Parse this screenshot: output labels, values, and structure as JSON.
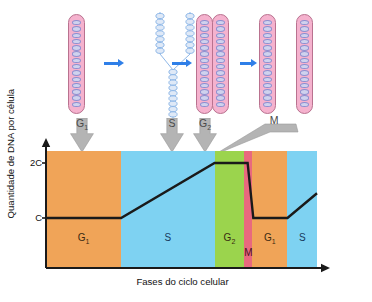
{
  "figure": {
    "credit": "OSVALDO SANCHES SEQUETIN",
    "stages": [
      {
        "name": "g1-chromosome",
        "label": "G₁",
        "label_main": "G",
        "label_sub": "1"
      },
      {
        "name": "s-replication-fork",
        "label": "S",
        "label_main": "S",
        "label_sub": ""
      },
      {
        "name": "g2-sister-chromatids",
        "label": "G₂",
        "label_main": "G",
        "label_sub": "2"
      },
      {
        "name": "m-separated-chromosomes",
        "label": "M",
        "label_main": "M",
        "label_sub": ""
      }
    ],
    "arrow_icons": [
      "arrow-right-icon",
      "arrow-right-icon",
      "arrow-right-icon"
    ]
  },
  "chart_data": {
    "type": "line",
    "title": "",
    "xlabel": "Fases do ciclo celular",
    "ylabel": "Quantidade de DNA por célula",
    "ytick_labels": [
      "2C",
      "C"
    ],
    "ytick_values": [
      2,
      1
    ],
    "ylim": [
      0,
      2.35
    ],
    "xlim": [
      0,
      100
    ],
    "grid": false,
    "legend": false,
    "x": [
      0,
      27.7,
      62.2,
      70.0,
      74.4,
      76.5,
      89.1,
      100
    ],
    "values": [
      1,
      1,
      2,
      2,
      2,
      1,
      1,
      1.45
    ],
    "series": [
      {
        "name": "DNA por célula",
        "color": "#1a1a1a",
        "points": [
          {
            "x": 0,
            "y": 1,
            "phase": "G1"
          },
          {
            "x": 27.7,
            "y": 1,
            "phase": "G1/S"
          },
          {
            "x": 62.2,
            "y": 2,
            "phase": "S/G2"
          },
          {
            "x": 70.0,
            "y": 2,
            "phase": "G2"
          },
          {
            "x": 74.4,
            "y": 2,
            "phase": "G2/M"
          },
          {
            "x": 76.5,
            "y": 1,
            "phase": "M"
          },
          {
            "x": 89.1,
            "y": 1,
            "phase": "G1"
          },
          {
            "x": 100,
            "y": 1.45,
            "phase": "S"
          }
        ]
      }
    ],
    "bands": [
      {
        "label": "G₁",
        "label_main": "G",
        "label_sub": "1",
        "x0": 0,
        "x1": 27.7,
        "color": "#f0a458",
        "name": "band-g1-first"
      },
      {
        "label": "S",
        "label_main": "S",
        "label_sub": "",
        "x0": 27.7,
        "x1": 62.2,
        "color": "#7ed2f2",
        "name": "band-s-first"
      },
      {
        "label": "G₂",
        "label_main": "G",
        "label_sub": "2",
        "x0": 62.2,
        "x1": 73.2,
        "color": "#9bd44d",
        "name": "band-g2"
      },
      {
        "label": "M",
        "label_main": "M",
        "label_sub": "",
        "x0": 73.2,
        "x1": 76.1,
        "color": "#e8697e",
        "name": "band-m"
      },
      {
        "label": "G₁",
        "label_main": "G",
        "label_sub": "1",
        "x0": 76.1,
        "x1": 89.1,
        "color": "#f0a458",
        "name": "band-g1-second"
      },
      {
        "label": "S",
        "label_main": "S",
        "label_sub": "",
        "x0": 89.1,
        "x1": 100,
        "color": "#7ed2f2",
        "name": "band-s-second"
      }
    ],
    "colors": {
      "g1": "#f0a458",
      "s": "#7ed2f2",
      "g2": "#9bd44d",
      "m": "#e8697e",
      "curve": "#1a1a1a",
      "axis": "#1a1a1a",
      "pointer": "#b0b0b0",
      "chromosome": "#f5b2ce",
      "dna": "#cfd2ee",
      "arrow": "#2f7fe8"
    }
  }
}
